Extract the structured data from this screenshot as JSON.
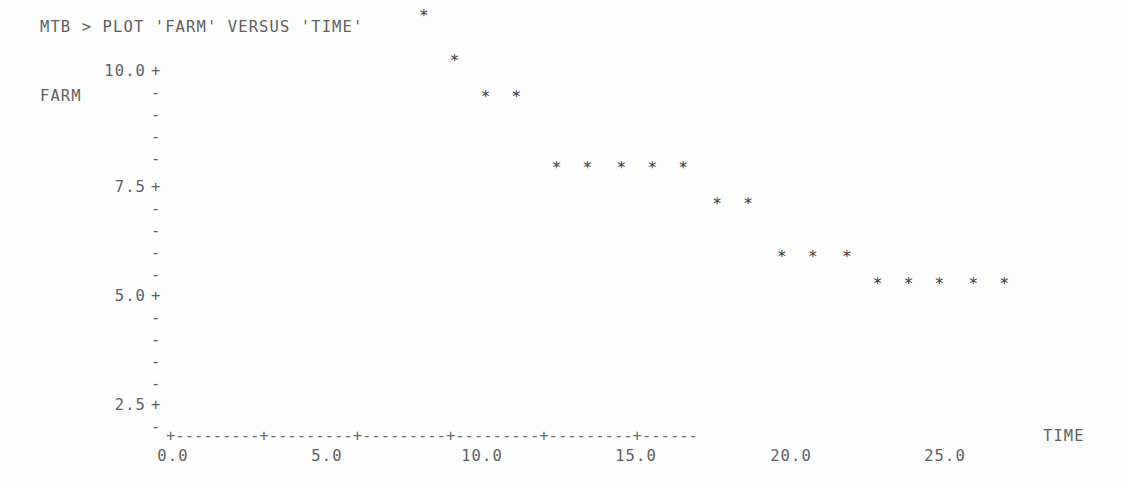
{
  "terminal": {
    "prompt_line": "MTB > PLOT 'FARM' VERSUS 'TIME'"
  },
  "axes": {
    "y_title": "FARM",
    "x_title": "TIME",
    "y_tick_labels": [
      "10.0",
      "7.5",
      "5.0",
      "2.5"
    ],
    "x_tick_labels": [
      "0.0",
      "5.0",
      "10.0",
      "15.0",
      "20.0",
      "25.0"
    ],
    "tick_glyph": "+",
    "minor_glyph": "-",
    "point_glyph": "*",
    "x_axis_line": "+---------+---------+---------+---------+---------+------"
  },
  "chart_data": {
    "type": "scatter",
    "title": "PLOT 'FARM' VERSUS 'TIME'",
    "xlabel": "TIME",
    "ylabel": "FARM",
    "xlim": [
      0.0,
      27.5
    ],
    "ylim": [
      2.2,
      10.3
    ],
    "xticks": [
      0.0,
      5.0,
      10.0,
      15.0,
      20.0,
      25.0
    ],
    "yticks": [
      2.5,
      5.0,
      7.5,
      10.0
    ],
    "grid": false,
    "legend": null,
    "marker": "*",
    "x": [
      1.0,
      2.0,
      3.4,
      4.4,
      5.4,
      6.4,
      7.3,
      8.2,
      9.2,
      10.2,
      11.2,
      12.5,
      13.5,
      14.6,
      15.6,
      16.6,
      17.7,
      18.7,
      19.8,
      20.8,
      21.9,
      22.9,
      23.9,
      24.9,
      26.0,
      27.0
    ],
    "y": [
      10.0,
      9.7,
      8.8,
      8.4,
      7.6,
      7.2,
      7.2,
      6.8,
      6.3,
      5.9,
      5.9,
      5.1,
      5.1,
      5.1,
      5.1,
      5.1,
      4.7,
      4.7,
      4.1,
      4.1,
      4.1,
      3.8,
      3.8,
      3.8,
      3.8,
      3.8
    ],
    "points": [
      {
        "x": 1.0,
        "y": 10.0
      },
      {
        "x": 2.0,
        "y": 9.7
      },
      {
        "x": 3.4,
        "y": 8.8
      },
      {
        "x": 4.4,
        "y": 8.4
      },
      {
        "x": 5.4,
        "y": 7.6
      },
      {
        "x": 6.4,
        "y": 7.2
      },
      {
        "x": 7.3,
        "y": 7.2
      },
      {
        "x": 8.2,
        "y": 6.8
      },
      {
        "x": 9.2,
        "y": 6.3
      },
      {
        "x": 10.2,
        "y": 5.9
      },
      {
        "x": 11.2,
        "y": 5.9
      },
      {
        "x": 12.5,
        "y": 5.1
      },
      {
        "x": 13.5,
        "y": 5.1
      },
      {
        "x": 14.6,
        "y": 5.1
      },
      {
        "x": 15.6,
        "y": 5.1
      },
      {
        "x": 16.6,
        "y": 5.1
      },
      {
        "x": 17.7,
        "y": 4.7
      },
      {
        "x": 18.7,
        "y": 4.7
      },
      {
        "x": 19.8,
        "y": 4.1
      },
      {
        "x": 20.8,
        "y": 4.1
      },
      {
        "x": 21.9,
        "y": 4.1
      },
      {
        "x": 22.9,
        "y": 3.8
      },
      {
        "x": 23.9,
        "y": 3.8
      },
      {
        "x": 24.9,
        "y": 3.8
      },
      {
        "x": 26.0,
        "y": 3.8
      },
      {
        "x": 27.0,
        "y": 3.8
      }
    ]
  },
  "render": {
    "x_origin_px": 170,
    "px_per_x_unit": 30.88,
    "y_origin_px": 400,
    "y_origin_value": 2.5,
    "px_per_y_unit": 89.2,
    "y_axis_rows": [
      {
        "value": "10.0",
        "glyph": "+",
        "top": 62,
        "labelled": true
      },
      {
        "value": "",
        "glyph": "-",
        "top": 84,
        "labelled": false
      },
      {
        "value": "",
        "glyph": "-",
        "top": 106,
        "labelled": false
      },
      {
        "value": "",
        "glyph": "-",
        "top": 128,
        "labelled": false
      },
      {
        "value": "",
        "glyph": "-",
        "top": 150,
        "labelled": false
      },
      {
        "value": "7.5",
        "glyph": "+",
        "top": 178,
        "labelled": true
      },
      {
        "value": "",
        "glyph": "-",
        "top": 200,
        "labelled": false
      },
      {
        "value": "",
        "glyph": "-",
        "top": 222,
        "labelled": false
      },
      {
        "value": "",
        "glyph": "-",
        "top": 244,
        "labelled": false
      },
      {
        "value": "",
        "glyph": "-",
        "top": 266,
        "labelled": false
      },
      {
        "value": "5.0",
        "glyph": "+",
        "top": 287,
        "labelled": true
      },
      {
        "value": "",
        "glyph": "-",
        "top": 309,
        "labelled": false
      },
      {
        "value": "",
        "glyph": "-",
        "top": 331,
        "labelled": false
      },
      {
        "value": "",
        "glyph": "-",
        "top": 353,
        "labelled": false
      },
      {
        "value": "",
        "glyph": "-",
        "top": 375,
        "labelled": false
      },
      {
        "value": "2.5",
        "glyph": "+",
        "top": 396,
        "labelled": true
      },
      {
        "value": "",
        "glyph": "-",
        "top": 418,
        "labelled": false
      }
    ],
    "x_tick_positions": [
      170,
      324,
      479,
      633,
      788,
      942
    ]
  }
}
